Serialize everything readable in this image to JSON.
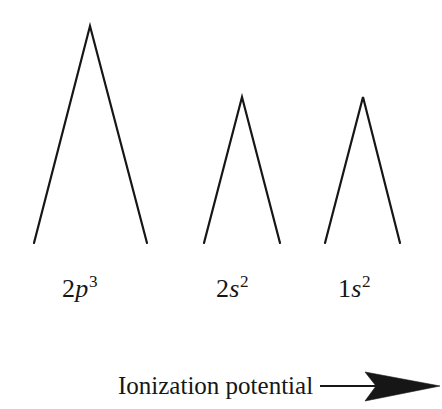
{
  "figure": {
    "background_color": "#ffffff",
    "ink_color": "#161616",
    "width": 442,
    "height": 409
  },
  "chart_data": {
    "type": "line",
    "title": "",
    "subtitle": "",
    "xlabel": "Ionization potential",
    "ylabel": "",
    "grid": false,
    "legend": "none",
    "categories": [
      "2p3",
      "2s2",
      "1s2"
    ],
    "series": [
      {
        "name": "photoelectron-signal",
        "values": [
          100,
          67,
          67
        ]
      }
    ],
    "peaks": [
      {
        "id": "peak-2p",
        "label_shell": "2",
        "label_subshell": "p",
        "label_electrons": "3",
        "label_plain": "2p3",
        "apex_x": 90,
        "apex_y": 26,
        "base_left_x": 34,
        "base_right_x": 147,
        "base_y": 243,
        "relative_height": 100,
        "relative_width": 113
      },
      {
        "id": "peak-2s",
        "label_shell": "2",
        "label_subshell": "s",
        "label_electrons": "2",
        "label_plain": "2s2",
        "apex_x": 242,
        "apex_y": 97,
        "base_left_x": 204,
        "base_right_x": 280,
        "base_y": 243,
        "relative_height": 67,
        "relative_width": 76
      },
      {
        "id": "peak-1s",
        "label_shell": "1",
        "label_subshell": "s",
        "label_electrons": "2",
        "label_plain": "1s2",
        "apex_x": 363,
        "apex_y": 97,
        "base_left_x": 325,
        "base_right_x": 400,
        "base_y": 243,
        "relative_height": 67,
        "relative_width": 75
      }
    ],
    "axis": {
      "caption": "Ionization potential",
      "direction": "increasing-to-the-right",
      "arrow_icon": "right-arrow-icon",
      "arrow_line_start_x": 320,
      "arrow_tip_x": 441,
      "arrow_y": 386
    },
    "stroke_width": 2.2
  },
  "labels": {
    "peak_1": {
      "shell": "2",
      "subshell": "p",
      "electrons": "3"
    },
    "peak_2": {
      "shell": "2",
      "subshell": "s",
      "electrons": "2"
    },
    "peak_3": {
      "shell": "1",
      "subshell": "s",
      "electrons": "2"
    },
    "axis_caption": "Ionization potential"
  }
}
